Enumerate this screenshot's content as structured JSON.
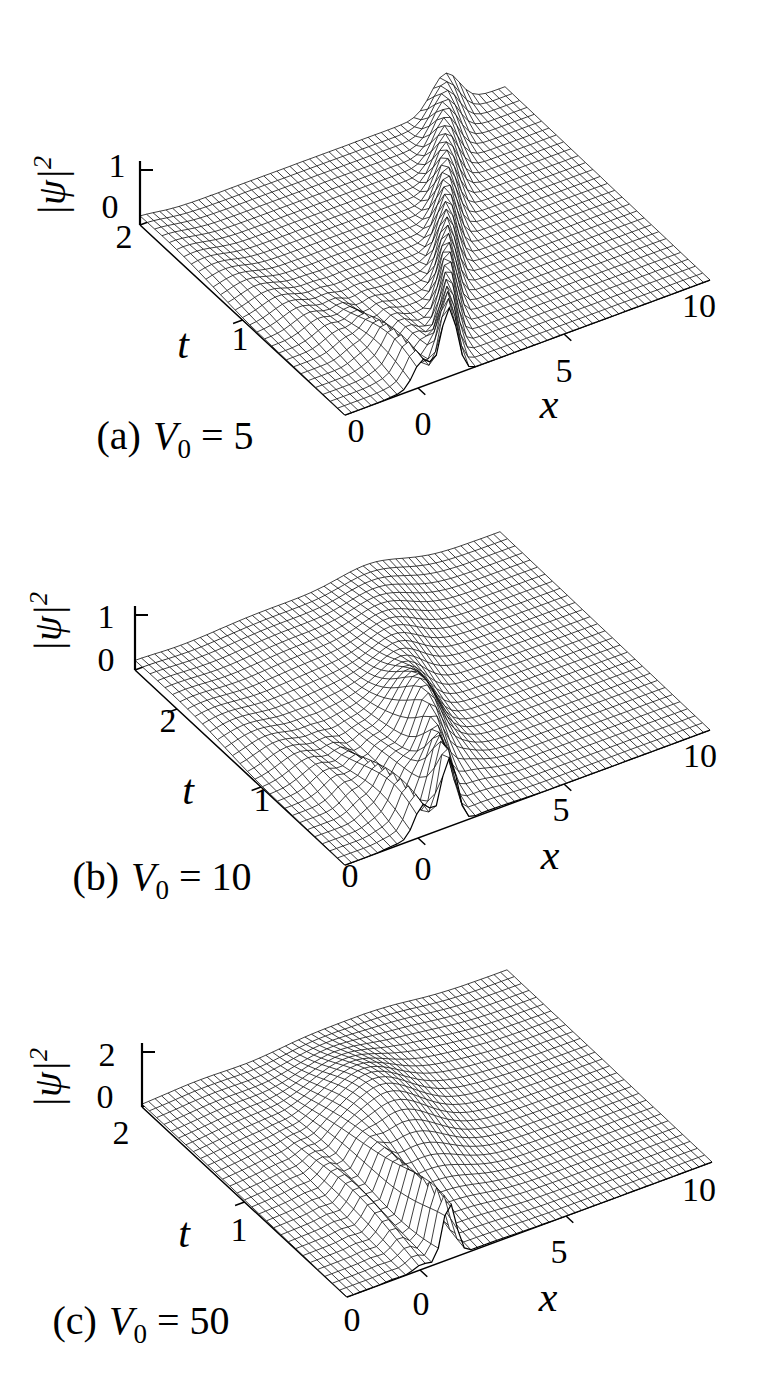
{
  "colors": {
    "ink": "#000000",
    "background": "#ffffff"
  },
  "chart_data": {
    "type": "surface",
    "panels": [
      {
        "id": "a",
        "caption": {
          "prefix": "(a)",
          "symbol": "V",
          "subscript": "0",
          "equals": "=",
          "value": "5",
          "text": "(a) V0 = 5"
        },
        "axes": {
          "x": {
            "label": "x",
            "range": [
              -2.5,
              10
            ],
            "ticks": [
              "0",
              "5",
              "10"
            ],
            "tick_values": [
              0,
              5,
              10
            ]
          },
          "t": {
            "label": "t",
            "range": [
              0,
              2
            ],
            "ticks": [
              "0",
              "1",
              "2"
            ],
            "tick_values": [
              0,
              1,
              2
            ]
          },
          "z": {
            "label_base": "|ψ|",
            "label_sup": "2",
            "label_text": "|ψ|²",
            "range": [
              0,
              1
            ],
            "ticks": [
              "0",
              "1"
            ]
          }
        },
        "surface_model": {
          "base": 0.06,
          "components": [
            {
              "type": "packet",
              "amp": 1.15,
              "x0": 1.05,
              "v": 3.45,
              "w0": 0.38,
              "spread": 0.28
            },
            {
              "type": "ripple",
              "amp": 0.5,
              "k": 2.4,
              "x0": 0.05,
              "xc": 0.45,
              "tc": 0.3,
              "wx": 0.8,
              "wt": 0.45
            },
            {
              "type": "packet",
              "amp": 0.22,
              "x0": 0.2,
              "v": -1.5,
              "w0": 0.6,
              "spread": 0.5
            }
          ]
        }
      },
      {
        "id": "b",
        "caption": {
          "prefix": "(b)",
          "symbol": "V",
          "subscript": "0",
          "equals": "=",
          "value": "10",
          "text": "(b) V0 = 10"
        },
        "axes": {
          "x": {
            "label": "x",
            "range": [
              -2.5,
              10
            ],
            "ticks": [
              "0",
              "5",
              "10"
            ],
            "tick_values": [
              0,
              5,
              10
            ]
          },
          "t": {
            "label": "t",
            "range": [
              0,
              2.5
            ],
            "ticks": [
              "0",
              "1",
              "2"
            ],
            "tick_values": [
              0,
              1,
              2
            ]
          },
          "z": {
            "label_base": "|ψ|",
            "label_sup": "2",
            "label_text": "|ψ|²",
            "range": [
              0,
              1
            ],
            "ticks": [
              "0",
              "1"
            ]
          }
        },
        "surface_model": {
          "base": 0.06,
          "components": [
            {
              "type": "packet",
              "amp": 1.15,
              "x0": 1.05,
              "v": 1.8,
              "w0": 0.36,
              "spread": 0.62
            },
            {
              "type": "bump",
              "amp": 0.45,
              "xc": 2.6,
              "tc": 0.85,
              "wx": 1.0,
              "wt": 0.5
            },
            {
              "type": "ripple",
              "amp": 0.55,
              "k": 2.6,
              "x0": 0.1,
              "xc": 0.5,
              "tc": 0.4,
              "wx": 0.9,
              "wt": 0.55
            },
            {
              "type": "packet",
              "amp": 0.3,
              "x0": 0.2,
              "v": -1.2,
              "w0": 0.55,
              "spread": 0.6
            },
            {
              "type": "bump",
              "amp": 0.18,
              "xc": 2.0,
              "tc": 2.1,
              "wx": 3.0,
              "wt": 0.9
            }
          ]
        }
      },
      {
        "id": "c",
        "caption": {
          "prefix": "(c)",
          "symbol": "V",
          "subscript": "0",
          "equals": "=",
          "value": "50",
          "text": "(c) V0 = 50"
        },
        "axes": {
          "x": {
            "label": "x",
            "range": [
              -2.5,
              10
            ],
            "ticks": [
              "0",
              "5",
              "10"
            ],
            "tick_values": [
              0,
              5,
              10
            ]
          },
          "t": {
            "label": "t",
            "range": [
              0,
              2
            ],
            "ticks": [
              "0",
              "1",
              "2"
            ],
            "tick_values": [
              0,
              1,
              2
            ]
          },
          "z": {
            "label_base": "|ψ|",
            "label_sup": "2",
            "label_text": "|ψ|²",
            "range": [
              0,
              2
            ],
            "ticks": [
              "0",
              "2"
            ]
          }
        },
        "surface_model": {
          "base": 0.08,
          "components": [
            {
              "type": "packet",
              "amp": 1.9,
              "x0": 1.0,
              "v": 0.4,
              "w0": 0.33,
              "spread": 0.25,
              "td": 0.7
            },
            {
              "type": "bump",
              "amp": 1.25,
              "xc": 2.3,
              "tc": 1.0,
              "wx": 1.5,
              "wt": 0.55
            },
            {
              "type": "bump",
              "amp": 0.8,
              "xc": 3.3,
              "tc": 1.35,
              "wx": 1.6,
              "wt": 0.55
            },
            {
              "type": "ripple",
              "amp": 0.7,
              "k": 2.8,
              "x0": 0.0,
              "xc": 0.4,
              "tc": 0.55,
              "wx": 0.9,
              "wt": 0.5
            },
            {
              "type": "bump",
              "amp": 0.22,
              "xc": -0.5,
              "tc": 1.4,
              "wx": 1.6,
              "wt": 0.8
            },
            {
              "type": "bump",
              "amp": 0.3,
              "xc": 5.5,
              "tc": 1.8,
              "wx": 1.8,
              "wt": 0.6
            }
          ]
        }
      }
    ]
  }
}
